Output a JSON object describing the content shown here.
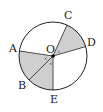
{
  "diagram": {
    "type": "circle-sectors",
    "center": {
      "label": "O",
      "x": 53,
      "y": 56
    },
    "radius": 34,
    "points": [
      {
        "label": "A",
        "x": 19.4,
        "y": 51.0,
        "lx": 9,
        "ly": 52
      },
      {
        "label": "B",
        "x": 29.0,
        "y": 80.0,
        "lx": 18,
        "ly": 89
      },
      {
        "label": "C",
        "x": 67.0,
        "y": 25.0,
        "lx": 64,
        "ly": 19
      },
      {
        "label": "D",
        "x": 86.0,
        "y": 46.5,
        "lx": 87,
        "ly": 46
      },
      {
        "label": "E",
        "x": 53.0,
        "y": 90.0,
        "lx": 50,
        "ly": 102
      }
    ],
    "shaded_sectors": [
      {
        "from": "C",
        "to": "D"
      },
      {
        "from": "A",
        "to": "E"
      }
    ],
    "colors": {
      "stroke": "#222222",
      "shade": "#cfcfcf",
      "center_dot": "#000000"
    }
  }
}
